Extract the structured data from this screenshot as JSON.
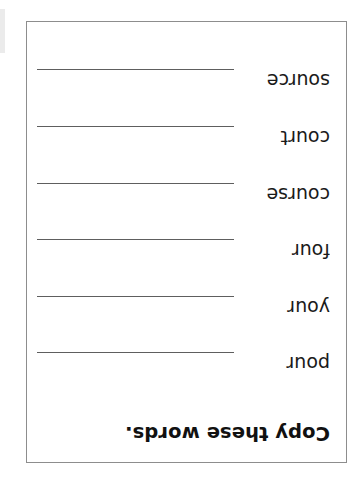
{
  "document": {
    "kind": "handwriting-copy-worksheet",
    "orientation_note": "scanned upside-down (rotated 180 degrees)",
    "page_background_color": "#ffffff",
    "border_color": "#8d8d8d",
    "text_color": "#1a1a1a",
    "line_color": "#5e5e5e",
    "title": "Copy these words.",
    "words": [
      {
        "label": "pour"
      },
      {
        "label": "your"
      },
      {
        "label": "four"
      },
      {
        "label": "course"
      },
      {
        "label": "court"
      },
      {
        "label": "source"
      }
    ]
  }
}
